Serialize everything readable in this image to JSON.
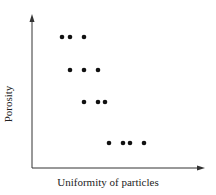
{
  "chart_data": {
    "type": "scatter",
    "title": "",
    "xlabel": "Uniformity of particles",
    "ylabel": "Porosity",
    "grid": false,
    "legend": null,
    "axis_ticks": "none",
    "points": [
      {
        "x": 62,
        "y": 37
      },
      {
        "x": 70,
        "y": 37
      },
      {
        "x": 84,
        "y": 37
      },
      {
        "x": 70,
        "y": 70
      },
      {
        "x": 84,
        "y": 70
      },
      {
        "x": 98,
        "y": 70
      },
      {
        "x": 84,
        "y": 102
      },
      {
        "x": 98,
        "y": 102
      },
      {
        "x": 105,
        "y": 102
      },
      {
        "x": 109,
        "y": 143
      },
      {
        "x": 123,
        "y": 143
      },
      {
        "x": 130,
        "y": 143
      },
      {
        "x": 144,
        "y": 143
      }
    ],
    "note": "Points given in pixel coordinates; trend: porosity decreases as uniformity increases (rows step down-right)"
  },
  "colors": {
    "axis": "#333333",
    "point": "#111111"
  }
}
